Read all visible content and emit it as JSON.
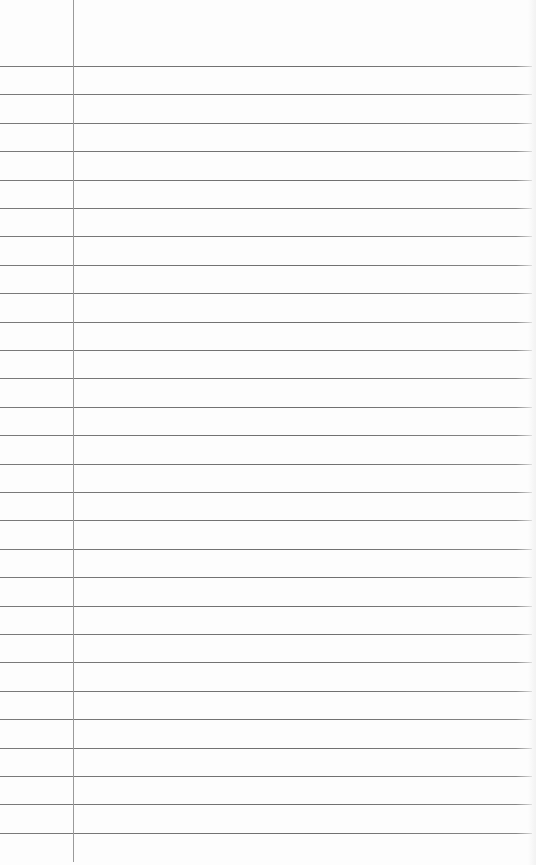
{
  "paper": {
    "type": "lined-notebook-page",
    "background": "#fdfdfd",
    "rule_color": "#707070",
    "margin_color": "#9a9a9a",
    "rule_count": 28,
    "first_rule_y": 66,
    "rule_spacing": 28.4,
    "rule_width": 532,
    "margin_x": 73,
    "margin_top": 0,
    "margin_bottom": 862
  }
}
